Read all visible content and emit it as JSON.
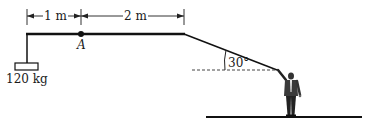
{
  "diagram": {
    "dimensions": [
      {
        "label": "1 m",
        "from": "left end",
        "to": "A"
      },
      {
        "label": "2 m",
        "from": "A",
        "to": "right end"
      }
    ],
    "point_label": "A",
    "mass_label": "120 kg",
    "angle_label": "30°",
    "colors": {
      "line": "#111111",
      "background": "#ffffff"
    }
  }
}
